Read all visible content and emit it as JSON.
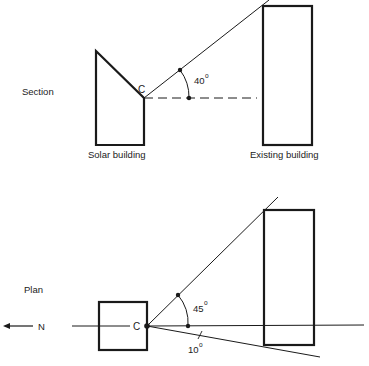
{
  "section": {
    "title": "Section",
    "point_label": "C",
    "angle_label": "40",
    "degree_symbol": "o",
    "solar_building_label": "Solar building",
    "existing_building_label": "Existing building"
  },
  "plan": {
    "title": "Plan",
    "point_label": "C",
    "north_label": "N",
    "angle_main_label": "45",
    "angle_minor_label": "10",
    "degree_symbol": "o"
  },
  "colors": {
    "ink": "#1a1a1a",
    "background": "#ffffff"
  }
}
